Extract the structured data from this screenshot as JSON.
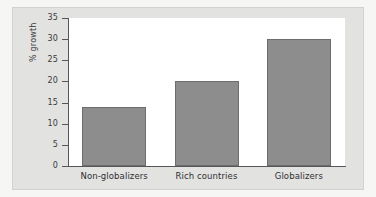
{
  "chart_data": {
    "type": "bar",
    "title": "",
    "xlabel": "",
    "ylabel": "% growth",
    "categories": [
      "Non-globalizers",
      "Rich countries",
      "Globalizers"
    ],
    "values": [
      14,
      20,
      30
    ],
    "ylim": [
      0,
      35
    ],
    "ytick_step": 5,
    "yticks": [
      "0",
      "5",
      "10",
      "15",
      "20",
      "25",
      "30",
      "35"
    ],
    "grid": false,
    "legend": null,
    "series": [
      {
        "name": "% growth",
        "values": [
          14,
          20,
          30
        ]
      }
    ]
  },
  "style": {
    "bar_fill": "#8d8d8d",
    "bar_stroke": "#6d6d70",
    "plot_background": "#ffffff",
    "panel_background": "#e2e2e1",
    "axis_color": "#56565a",
    "text_color": "#2f2f31"
  }
}
